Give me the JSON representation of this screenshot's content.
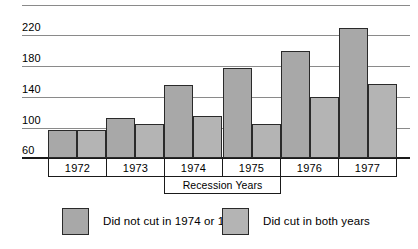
{
  "chart_data": {
    "type": "bar",
    "title": "",
    "subtitle": "",
    "xlabel": "",
    "ylabel": "",
    "categories": [
      "1972",
      "1973",
      "1974",
      "1975",
      "1976",
      "1977"
    ],
    "series": [
      {
        "name": "Did not cut in 1974 or 1975",
        "color": "#a8a8a8",
        "values": [
          97,
          112,
          155,
          178,
          200,
          230
        ]
      },
      {
        "name": "Did cut in both years",
        "color": "#b4b4b4",
        "values": [
          96,
          104,
          115,
          105,
          140,
          157
        ]
      }
    ],
    "ylim": [
      60,
      260
    ],
    "ytick_values": [
      260,
      220,
      180,
      140,
      100,
      60
    ],
    "ytick_labels": [
      "",
      "220",
      "180",
      "140",
      "100",
      "60"
    ],
    "grid": true,
    "legend_position": "bottom",
    "annotations": [
      {
        "name": "recession-bracket",
        "text": "Recession Years",
        "spans": [
          "1974",
          "1975"
        ]
      }
    ]
  },
  "axis": {
    "y_labels": [
      "220",
      "180",
      "140",
      "100",
      "60"
    ]
  },
  "year_axis": {
    "cells": [
      "1972",
      "1973",
      "1974",
      "1975",
      "1976",
      "1977"
    ]
  },
  "recession": {
    "label": "Recession Years"
  },
  "legend": {
    "entries": [
      {
        "label": "Did not cut in 1974 or 1975",
        "color": "#a8a8a8"
      },
      {
        "label": "Did cut in both years",
        "color": "#b4b4b4"
      }
    ]
  }
}
